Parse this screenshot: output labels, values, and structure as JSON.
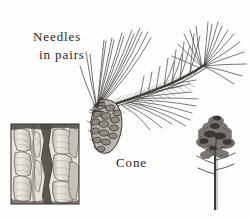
{
  "plate": {
    "kind": "botanical-illustration",
    "subject": "pine branch with cone, bark section and tree habit",
    "width": 250,
    "height": 219,
    "background_color": "#fefefd",
    "ink_color": "#2a2724"
  },
  "labels": {
    "needles_line1": "Needles",
    "needles_line2": "in pairs",
    "cone": "Cone"
  },
  "figures": {
    "bark": {
      "name": "bark-section",
      "caption": ""
    },
    "branch": {
      "name": "pine-branch",
      "caption": ""
    },
    "cone": {
      "name": "pine-cone",
      "caption": ""
    },
    "habit": {
      "name": "pine-tree-habit",
      "caption": ""
    }
  }
}
